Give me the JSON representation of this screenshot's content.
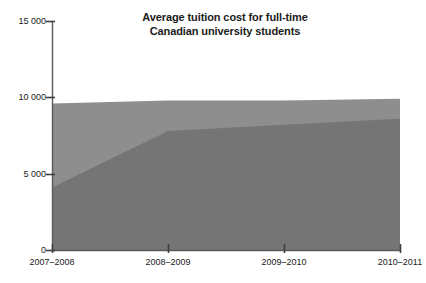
{
  "chart_data": {
    "type": "area",
    "title": "Average tuition cost for full-time Canadian university students",
    "title_line1": "Average tuition cost for full-time",
    "title_line2": "Canadian university students",
    "xlabel": "",
    "ylabel": "",
    "stacked": false,
    "grid": false,
    "legend_position": "inline-labels",
    "categories": [
      "2007–2008",
      "2008–2009",
      "2009–2010",
      "2010–2011"
    ],
    "ylim": [
      0,
      15000
    ],
    "yticks": [
      0,
      5000,
      10000,
      15000
    ],
    "ytick_labels": [
      "0",
      "5 000",
      "10 000",
      "15 000"
    ],
    "series": [
      {
        "name": "Medicine",
        "color": "#8e8e8e",
        "values": [
          9600,
          9800,
          9800,
          9900
        ]
      },
      {
        "name": "Pharmacy",
        "color": "#757575",
        "values": [
          4100,
          7800,
          8200,
          8600
        ]
      }
    ],
    "annotations": [
      {
        "text": "Medicine",
        "x_frac": 0.055,
        "value": 8800
      },
      {
        "text": "Pharmacy",
        "x_frac": 0.16,
        "value": 4600
      }
    ]
  },
  "axis": {
    "line_color": "#5a5a5a",
    "tick_color": "#3f3f3f"
  }
}
